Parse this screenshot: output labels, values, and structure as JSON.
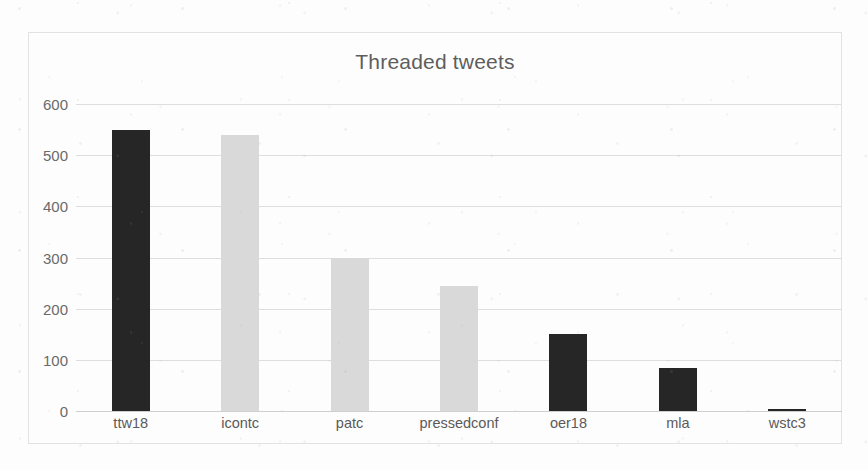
{
  "chart_data": {
    "type": "bar",
    "title": "Threaded tweets",
    "xlabel": "",
    "ylabel": "",
    "categories": [
      "ttw18",
      "icontc",
      "patc",
      "pressedconf",
      "oer18",
      "mla",
      "wstc3"
    ],
    "values": [
      550,
      540,
      300,
      245,
      150,
      85,
      4
    ],
    "bar_colors": [
      "#262626",
      "#d9d9d9",
      "#d9d9d9",
      "#d9d9d9",
      "#262626",
      "#262626",
      "#262626"
    ],
    "ylim": [
      0,
      600
    ],
    "yticks": [
      0,
      100,
      200,
      300,
      400,
      500,
      600
    ],
    "ytick_labels": [
      "0",
      "100",
      "200",
      "300",
      "400",
      "500",
      "600"
    ],
    "grid": "horizontal",
    "legend": "none",
    "series": [
      {
        "name": "Threaded tweets",
        "values": [
          550,
          540,
          300,
          245,
          150,
          85,
          4
        ]
      }
    ]
  },
  "style": {
    "title_color": "#5e5e5e",
    "tick_color": "#6a6a6a",
    "gridline_color": "#dedede",
    "border_color": "#e2e2e2",
    "background": "#fdfdfd",
    "dark_bar": "#262626",
    "light_bar": "#d9d9d9"
  }
}
